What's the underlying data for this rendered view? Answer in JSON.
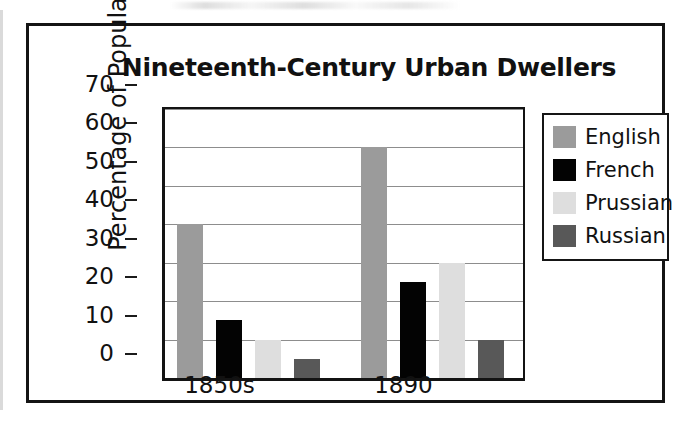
{
  "chart_data": {
    "type": "bar",
    "title": "Nineteenth-Century Urban Dwellers",
    "xlabel": "",
    "ylabel": "Percentage of Population",
    "categories": [
      "1850s",
      "1890"
    ],
    "series": [
      {
        "name": "English",
        "color": "#9b9b9b",
        "values": [
          40,
          60
        ]
      },
      {
        "name": "French",
        "color": "#030303",
        "values": [
          15,
          25
        ]
      },
      {
        "name": "Prussian",
        "color": "#dedede",
        "values": [
          10,
          30
        ]
      },
      {
        "name": "Russian",
        "color": "#585858",
        "values": [
          5,
          10
        ]
      }
    ],
    "ylim": [
      0,
      70
    ],
    "ytick_step": 10,
    "yticks": [
      "70",
      "60",
      "50",
      "40",
      "30",
      "20",
      "10",
      "0"
    ],
    "grid": true,
    "legend_position": "right"
  },
  "legend": {
    "entries": [
      {
        "label": "English",
        "swatch": "english-swatch"
      },
      {
        "label": "French",
        "swatch": "french-swatch"
      },
      {
        "label": "Prussian",
        "swatch": "prussian-swatch"
      },
      {
        "label": "Russian",
        "swatch": "russian-swatch"
      }
    ]
  }
}
